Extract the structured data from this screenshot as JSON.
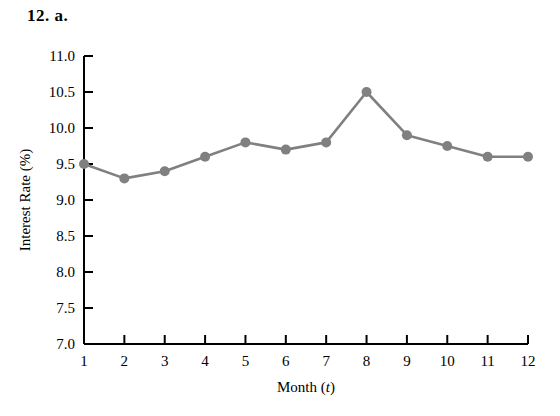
{
  "problem": {
    "label": "12. a."
  },
  "chart_data": {
    "type": "line",
    "title": "",
    "xlabel": "Month (t)",
    "ylabel": "Interest Rate (%)",
    "x": [
      1,
      2,
      3,
      4,
      5,
      6,
      7,
      8,
      9,
      10,
      11,
      12
    ],
    "values": [
      9.5,
      9.3,
      9.4,
      9.6,
      9.8,
      9.7,
      9.8,
      10.5,
      9.9,
      9.75,
      9.6,
      9.6
    ],
    "xlim": [
      1,
      12
    ],
    "ylim": [
      7.0,
      11.0
    ],
    "xticks": [
      "1",
      "2",
      "3",
      "4",
      "5",
      "6",
      "7",
      "8",
      "9",
      "10",
      "11",
      "12"
    ],
    "yticks": [
      "7.0",
      "7.5",
      "8.0",
      "8.5",
      "9.0",
      "9.5",
      "10.0",
      "10.5",
      "11.0"
    ],
    "ytick_values": [
      7.0,
      7.5,
      8.0,
      8.5,
      9.0,
      9.5,
      10.0,
      10.5,
      11.0
    ],
    "grid": false,
    "legend": null,
    "series_color": "#808080",
    "axis_color": "#000000",
    "marker": "circle",
    "marker_size": 10
  },
  "axis": {
    "x_title_main": "Month (",
    "x_title_italic": "t",
    "x_title_end": ")",
    "y_title": "Interest Rate (%)"
  }
}
